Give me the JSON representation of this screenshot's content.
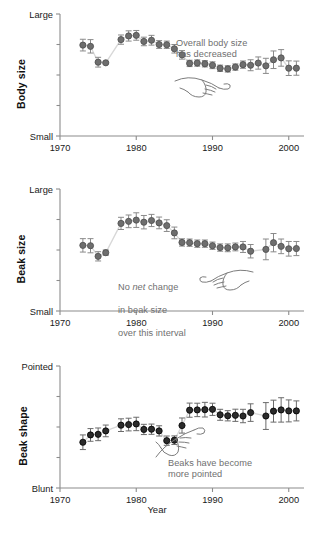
{
  "figure": {
    "xaxis_title": "Year",
    "x_ticks": [
      "1970",
      "1980",
      "1990",
      "2000"
    ],
    "x_tick_values": [
      1970,
      1980,
      1990,
      2000
    ],
    "xlim": [
      1970,
      2002
    ],
    "marker_color_light": "#6e6e6e",
    "marker_color_dark": "#2b2b2b",
    "errorbar_color": "#8a8a8a",
    "connector_color": "#d8d8d8",
    "axis_color": "#8c8c8c",
    "annotation_color": "#6f6f6f"
  },
  "chart_data": [
    {
      "type": "line",
      "panel_id": "body-size",
      "title": "",
      "ylabel": "Body size",
      "xlabel": "Year",
      "ytick_labels": [
        "Large",
        "Small"
      ],
      "ylim": [
        0,
        1
      ],
      "ylim_labels": {
        "top": "Large",
        "bottom": "Small"
      },
      "y_inner_ticks": [
        0.25,
        0.5,
        0.75
      ],
      "grid": false,
      "legend": "none",
      "annotation": "Overall body size\nhas decreased",
      "annotation_icon": "pointing-hand-icon",
      "x": [
        1973,
        1974,
        1975,
        1976,
        1978,
        1979,
        1980,
        1981,
        1982,
        1983,
        1984,
        1985,
        1986,
        1987,
        1988,
        1989,
        1990,
        1991,
        1992,
        1993,
        1994,
        1995,
        1996,
        1997,
        1998,
        1999,
        2000,
        2001
      ],
      "values": [
        0.745,
        0.735,
        0.605,
        0.6,
        0.79,
        0.82,
        0.825,
        0.775,
        0.785,
        0.75,
        0.748,
        0.715,
        0.665,
        0.595,
        0.598,
        0.592,
        0.58,
        0.555,
        0.55,
        0.565,
        0.585,
        0.58,
        0.598,
        0.575,
        0.625,
        0.64,
        0.556,
        0.556
      ],
      "err_low": [
        0.048,
        0.055,
        0.04,
        0.008,
        0.038,
        0.042,
        0.04,
        0.035,
        0.04,
        0.032,
        0.03,
        0.035,
        0.035,
        0.026,
        0.026,
        0.026,
        0.028,
        0.026,
        0.026,
        0.026,
        0.03,
        0.045,
        0.05,
        0.062,
        0.072,
        0.068,
        0.06,
        0.058
      ],
      "err_high": [
        0.048,
        0.055,
        0.04,
        0.008,
        0.038,
        0.042,
        0.04,
        0.035,
        0.04,
        0.032,
        0.03,
        0.035,
        0.035,
        0.026,
        0.026,
        0.026,
        0.028,
        0.026,
        0.026,
        0.026,
        0.03,
        0.045,
        0.05,
        0.062,
        0.072,
        0.068,
        0.06,
        0.058
      ]
    },
    {
      "type": "line",
      "panel_id": "beak-size",
      "title": "",
      "ylabel": "Beak size",
      "xlabel": "Year",
      "ytick_labels": [
        "Large",
        "Small"
      ],
      "ylim": [
        0,
        1
      ],
      "ylim_labels": {
        "top": "Large",
        "bottom": "Small"
      },
      "y_inner_ticks": [
        0.25,
        0.5,
        0.75
      ],
      "grid": false,
      "legend": "none",
      "annotation_plain_1": "No ",
      "annotation_italic": "net",
      "annotation_plain_2": " change",
      "annotation_line2": "in beak size",
      "annotation_line3": "over this interval",
      "annotation_icon": "pointing-hand-icon",
      "x": [
        1973,
        1974,
        1975,
        1976,
        1978,
        1979,
        1980,
        1981,
        1982,
        1983,
        1984,
        1985,
        1986,
        1987,
        1988,
        1989,
        1990,
        1991,
        1992,
        1993,
        1994,
        1995,
        1997,
        1998,
        1999,
        2000,
        2001
      ],
      "values": [
        0.538,
        0.535,
        0.448,
        0.478,
        0.718,
        0.735,
        0.745,
        0.728,
        0.742,
        0.722,
        0.7,
        0.64,
        0.562,
        0.56,
        0.552,
        0.552,
        0.535,
        0.52,
        0.518,
        0.525,
        0.525,
        0.49,
        0.505,
        0.56,
        0.53,
        0.51,
        0.512
      ],
      "err_low": [
        0.055,
        0.058,
        0.038,
        0.022,
        0.05,
        0.052,
        0.06,
        0.055,
        0.05,
        0.048,
        0.048,
        0.048,
        0.03,
        0.03,
        0.03,
        0.03,
        0.03,
        0.03,
        0.032,
        0.032,
        0.045,
        0.055,
        0.085,
        0.075,
        0.06,
        0.06,
        0.058
      ],
      "err_high": [
        0.055,
        0.058,
        0.038,
        0.022,
        0.05,
        0.052,
        0.06,
        0.055,
        0.05,
        0.048,
        0.048,
        0.048,
        0.03,
        0.03,
        0.03,
        0.03,
        0.03,
        0.03,
        0.032,
        0.032,
        0.045,
        0.055,
        0.085,
        0.075,
        0.06,
        0.06,
        0.058
      ]
    },
    {
      "type": "line",
      "panel_id": "beak-shape",
      "title": "",
      "ylabel": "Beak shape",
      "xlabel": "Year",
      "ytick_labels": [
        "Pointed",
        "Blunt"
      ],
      "ylim": [
        0,
        1
      ],
      "ylim_labels": {
        "top": "Pointed",
        "bottom": "Blunt"
      },
      "y_inner_ticks": [
        0.25,
        0.5,
        0.75
      ],
      "grid": false,
      "legend": "none",
      "annotation": "Beaks have become\nmore pointed",
      "annotation_icon": "pointing-hand-icon",
      "x": [
        1973,
        1974,
        1975,
        1976,
        1978,
        1979,
        1980,
        1981,
        1982,
        1983,
        1984,
        1985,
        1986,
        1987,
        1988,
        1989,
        1990,
        1991,
        1992,
        1993,
        1994,
        1995,
        1997,
        1998,
        1999,
        2000,
        2001
      ],
      "values": [
        0.375,
        0.435,
        0.44,
        0.468,
        0.515,
        0.52,
        0.525,
        0.48,
        0.482,
        0.468,
        0.388,
        0.392,
        0.512,
        0.638,
        0.64,
        0.642,
        0.645,
        0.6,
        0.592,
        0.596,
        0.59,
        0.618,
        0.59,
        0.63,
        0.64,
        0.632,
        0.632
      ],
      "err_low": [
        0.06,
        0.052,
        0.052,
        0.048,
        0.052,
        0.052,
        0.055,
        0.042,
        0.042,
        0.042,
        0.038,
        0.035,
        0.062,
        0.058,
        0.055,
        0.06,
        0.05,
        0.045,
        0.042,
        0.05,
        0.055,
        0.072,
        0.11,
        0.09,
        0.1,
        0.09,
        0.082
      ],
      "err_high": [
        0.06,
        0.052,
        0.052,
        0.048,
        0.052,
        0.052,
        0.055,
        0.042,
        0.042,
        0.042,
        0.038,
        0.035,
        0.062,
        0.058,
        0.055,
        0.06,
        0.05,
        0.045,
        0.042,
        0.05,
        0.055,
        0.072,
        0.11,
        0.09,
        0.1,
        0.09,
        0.082
      ]
    }
  ]
}
